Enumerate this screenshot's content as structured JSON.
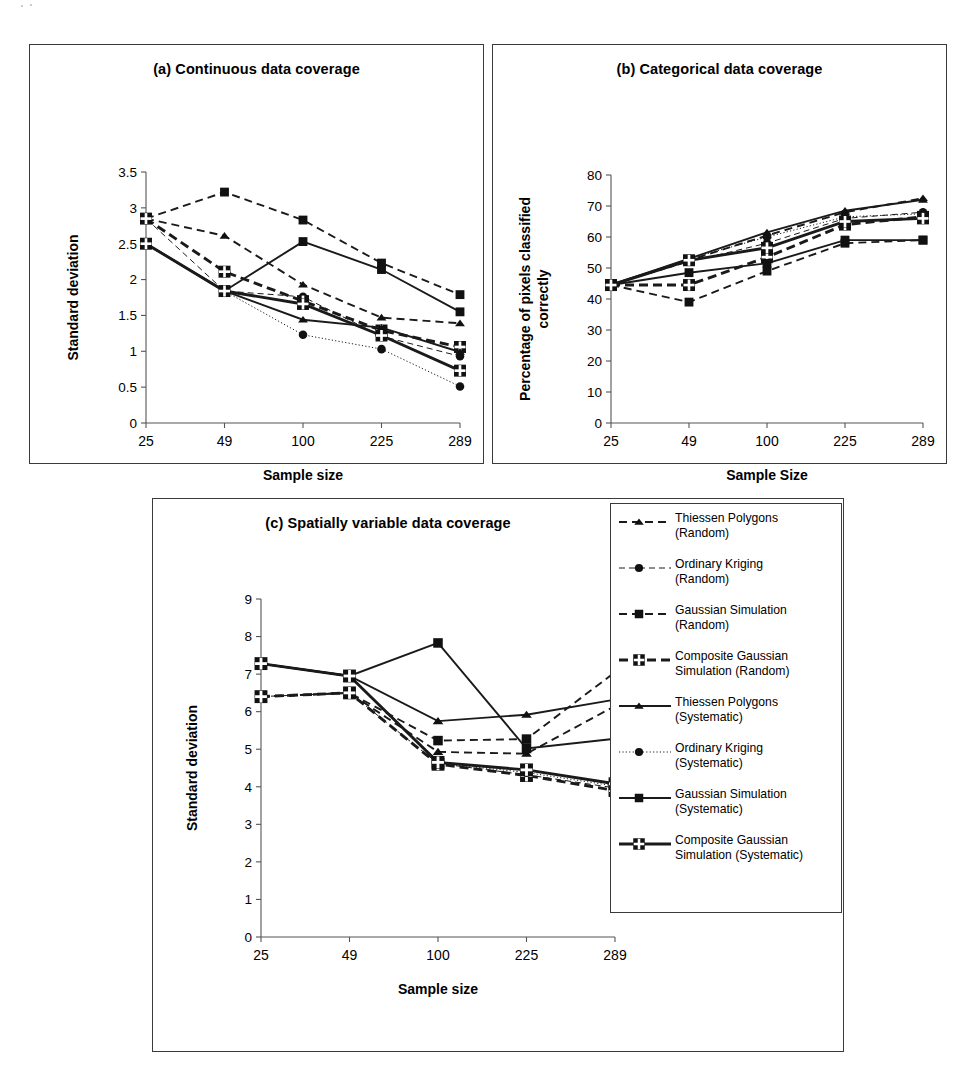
{
  "figure": {
    "series_defs": [
      {
        "key": "tp_rand",
        "label_line1": "Thiessen Polygons",
        "label_line2": "(Random)",
        "marker": "triangle",
        "line": "dashed",
        "weight": "medium"
      },
      {
        "key": "ok_rand",
        "label_line1": "Ordinary Kriging",
        "label_line2": "(Random)",
        "marker": "circle",
        "line": "dashed",
        "weight": "thin"
      },
      {
        "key": "gs_rand",
        "label_line1": "Gaussian Simulation",
        "label_line2": "(Random)",
        "marker": "square",
        "line": "dashed",
        "weight": "medium"
      },
      {
        "key": "cgs_rand",
        "label_line1": "Composite Gaussian",
        "label_line2": "Simulation (Random)",
        "marker": "square-plus",
        "line": "dashed",
        "weight": "thick"
      },
      {
        "key": "tp_sys",
        "label_line1": "Thiessen Polygons",
        "label_line2": "(Systematic)",
        "marker": "triangle",
        "line": "solid",
        "weight": "medium"
      },
      {
        "key": "ok_sys",
        "label_line1": "Ordinary Kriging",
        "label_line2": "(Systematic)",
        "marker": "circle",
        "line": "dotted",
        "weight": "thin"
      },
      {
        "key": "gs_sys",
        "label_line1": "Gaussian Simulation",
        "label_line2": "(Systematic)",
        "marker": "square",
        "line": "solid",
        "weight": "medium"
      },
      {
        "key": "cgs_sys",
        "label_line1": "Composite Gaussian",
        "label_line2": "Simulation (Systematic)",
        "marker": "square-plus",
        "line": "solid",
        "weight": "thick"
      }
    ]
  },
  "chart_data": [
    {
      "panel": "a",
      "type": "line",
      "title": "(a) Continuous data coverage",
      "xlabel": "Sample size",
      "ylabel": "Standard deviation",
      "categories": [
        "25",
        "49",
        "100",
        "225",
        "289"
      ],
      "yticks": [
        "0",
        "0.5",
        "1",
        "1.5",
        "2",
        "2.5",
        "3",
        "3.5"
      ],
      "ylim": [
        0,
        3.5
      ],
      "grid": false,
      "legend": "shared-external",
      "series": [
        {
          "name": "Thiessen Polygons (Random)",
          "values": [
            2.85,
            2.61,
            1.93,
            1.47,
            1.39
          ]
        },
        {
          "name": "Ordinary Kriging (Random)",
          "values": [
            2.85,
            1.84,
            1.76,
            1.21,
            0.93
          ]
        },
        {
          "name": "Gaussian Simulation (Random)",
          "values": [
            2.85,
            3.22,
            2.83,
            2.23,
            1.79
          ]
        },
        {
          "name": "Composite Gaussian Simulation (Random)",
          "values": [
            2.85,
            2.11,
            1.7,
            1.29,
            1.06
          ]
        },
        {
          "name": "Thiessen Polygons (Systematic)",
          "values": [
            2.5,
            1.84,
            1.44,
            1.33,
            0.99
          ]
        },
        {
          "name": "Ordinary Kriging (Systematic)",
          "values": [
            2.5,
            1.84,
            1.23,
            1.03,
            0.51
          ]
        },
        {
          "name": "Gaussian Simulation (Systematic)",
          "values": [
            2.5,
            1.84,
            2.53,
            2.14,
            1.55
          ]
        },
        {
          "name": "Composite Gaussian Simulation (Systematic)",
          "values": [
            2.5,
            1.84,
            1.66,
            1.22,
            0.73
          ]
        }
      ]
    },
    {
      "panel": "b",
      "type": "line",
      "title": "(b) Categorical data coverage",
      "xlabel": "Sample Size",
      "ylabel": "Percentage of pixels classified correctly",
      "categories": [
        "25",
        "49",
        "100",
        "225",
        "289"
      ],
      "yticks": [
        "0",
        "10",
        "20",
        "30",
        "40",
        "50",
        "60",
        "70",
        "80"
      ],
      "ylim": [
        0,
        80
      ],
      "grid": false,
      "legend": "shared-external",
      "series": [
        {
          "name": "Thiessen Polygons (Random)",
          "values": [
            44.5,
            52.5,
            60.5,
            68.0,
            72.5
          ]
        },
        {
          "name": "Ordinary Kriging (Random)",
          "values": [
            44.5,
            52.0,
            58.0,
            66.0,
            68.0
          ]
        },
        {
          "name": "Gaussian Simulation (Random)",
          "values": [
            44.5,
            39.0,
            49.0,
            58.0,
            59.0
          ]
        },
        {
          "name": "Composite Gaussian Simulation (Random)",
          "values": [
            44.5,
            44.5,
            53.5,
            64.0,
            66.5
          ]
        },
        {
          "name": "Thiessen Polygons (Systematic)",
          "values": [
            44.5,
            53.0,
            61.5,
            68.5,
            72.0
          ]
        },
        {
          "name": "Ordinary Kriging (Systematic)",
          "values": [
            44.5,
            53.0,
            60.0,
            66.5,
            67.5
          ]
        },
        {
          "name": "Gaussian Simulation (Systematic)",
          "values": [
            44.5,
            48.5,
            51.5,
            59.0,
            59.0
          ]
        },
        {
          "name": "Composite Gaussian Simulation (Systematic)",
          "values": [
            44.5,
            52.5,
            56.5,
            65.0,
            66.0
          ]
        }
      ]
    },
    {
      "panel": "c",
      "type": "line",
      "title": "(c) Spatially variable data coverage",
      "xlabel": "Sample size",
      "ylabel": "Standard deviation",
      "categories": [
        "25",
        "49",
        "100",
        "225",
        "289"
      ],
      "yticks": [
        "0",
        "1",
        "2",
        "3",
        "4",
        "5",
        "6",
        "7",
        "8",
        "9"
      ],
      "ylim": [
        0,
        9
      ],
      "grid": false,
      "legend": "shared-external",
      "series": [
        {
          "name": "Thiessen Polygons (Random)",
          "values": [
            6.4,
            6.5,
            4.93,
            4.88,
            6.15
          ]
        },
        {
          "name": "Ordinary Kriging (Random)",
          "values": [
            6.4,
            6.5,
            4.62,
            4.32,
            3.97
          ]
        },
        {
          "name": "Gaussian Simulation (Random)",
          "values": [
            6.4,
            6.5,
            5.23,
            5.27,
            7.05
          ]
        },
        {
          "name": "Composite Gaussian Simulation (Random)",
          "values": [
            6.4,
            6.5,
            4.6,
            4.3,
            3.9
          ]
        },
        {
          "name": "Thiessen Polygons (Systematic)",
          "values": [
            7.28,
            6.95,
            5.75,
            5.92,
            6.32
          ]
        },
        {
          "name": "Ordinary Kriging (Systematic)",
          "values": [
            7.28,
            6.95,
            4.63,
            4.38,
            4.02
          ]
        },
        {
          "name": "Gaussian Simulation (Systematic)",
          "values": [
            7.28,
            6.95,
            7.83,
            5.02,
            5.28
          ]
        },
        {
          "name": "Composite Gaussian Simulation (Systematic)",
          "values": [
            7.28,
            6.95,
            4.65,
            4.45,
            4.08
          ]
        }
      ]
    }
  ]
}
